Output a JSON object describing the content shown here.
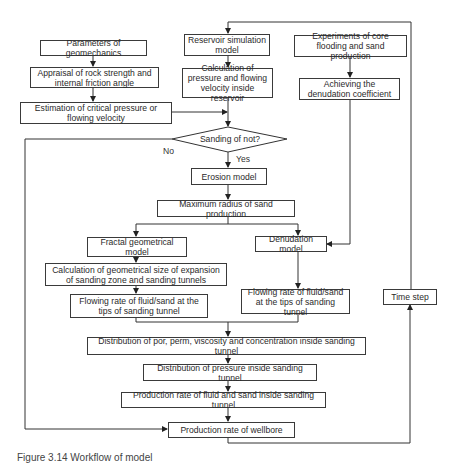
{
  "flowchart": {
    "nodes": {
      "geomechanics": "Parameters of geomechanics",
      "appraisal": "Appraisal of rock strength and internal friction angle",
      "estimation": "Estimation of critical pressure or flowing velocity",
      "reservoir_sim": "Reservoir simulation model",
      "calc_pressure": "Calculation of pressure and flowing velocity inside reservoir",
      "experiments": "Experiments of core flooding and sand production",
      "achieving": "Achieving the denudation coefficient",
      "decision": "Sanding of not?",
      "erosion": "Erosion model",
      "max_radius": "Maximum radius of sand production",
      "fractal": "Fractal geometrical model",
      "denudation": "Denudation model",
      "calc_geometrical": "Calculation of geometrical size of expansion of sanding zone and sanding tunnels",
      "flow_left": "Flowing rate of fluid/sand at the tips of sanding tunnel",
      "flow_right": "Flowing rate of fluid/sand at the tips of sanding tunnel",
      "time_step": "Time step",
      "dist_por": "Distribution of por, perm, viscosity and concentration inside sanding tunnel",
      "dist_pressure": "Distribution of pressure inside sanding tunnel",
      "prod_tunnel": "Production rate of fluid and sand inside sanding tunnel",
      "prod_wellbore": "Production rate of wellbore"
    },
    "edge_labels": {
      "no": "No",
      "yes": "Yes"
    }
  },
  "caption": "Figure 3.14  Workflow of model"
}
